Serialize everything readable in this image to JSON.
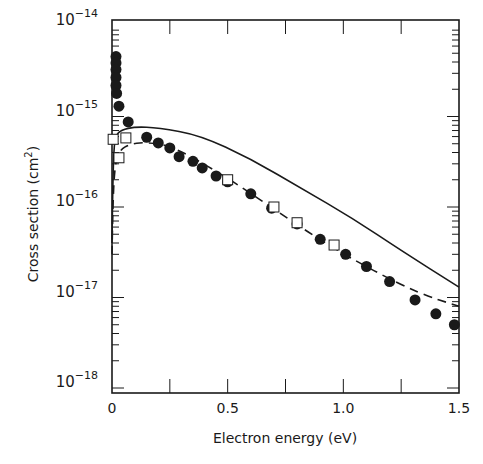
{
  "chart_data": {
    "type": "scatter",
    "title": "",
    "xlabel": "Electron energy (eV)",
    "ylabel": "Cross section (cm",
    "ylabel_sup": "2",
    "ylabel_close": ")",
    "xscale": "linear",
    "yscale": "log",
    "xlim": [
      0,
      1.5
    ],
    "ylim": [
      1e-18,
      1e-14
    ],
    "grid": false,
    "legend": null,
    "x_ticks": [
      {
        "value": 0,
        "label": "0"
      },
      {
        "value": 0.5,
        "label": "0.5"
      },
      {
        "value": 1.0,
        "label": "1.0"
      },
      {
        "value": 1.5,
        "label": "1.5"
      }
    ],
    "x_minor_ticks": [
      0.25,
      0.75,
      1.25
    ],
    "y_ticks": [
      {
        "value": 1e-14,
        "base": "10",
        "exp": "−14"
      },
      {
        "value": 1e-15,
        "base": "10",
        "exp": "−15"
      },
      {
        "value": 1e-16,
        "base": "10",
        "exp": "−16"
      },
      {
        "value": 1e-17,
        "base": "10",
        "exp": "−17"
      },
      {
        "value": 1e-18,
        "base": "10",
        "exp": "−18"
      }
    ],
    "series": [
      {
        "name": "Filled circles (measured)",
        "marker": "filled-circle",
        "x": [
          0.005,
          0.01,
          0.01,
          0.013,
          0.015,
          0.02,
          0.03,
          0.07,
          0.15,
          0.2,
          0.25,
          0.29,
          0.35,
          0.39,
          0.45,
          0.5,
          0.6,
          0.69,
          0.8,
          0.9,
          1.01,
          1.1,
          1.2,
          1.31,
          1.4,
          1.48
        ],
        "y": [
          4.6e-15,
          3.9e-15,
          3.3e-15,
          2.7e-15,
          2.2e-15,
          1.8e-15,
          1.3e-15,
          8.7e-16,
          5.9e-16,
          5.1e-16,
          4.5e-16,
          3.6e-16,
          3.2e-16,
          2.7e-16,
          2.2e-16,
          1.9e-16,
          1.4e-16,
          9.7e-17,
          6.5e-17,
          4.4e-17,
          3e-17,
          2.2e-17,
          1.5e-17,
          9.4e-18,
          6.6e-18,
          5e-18
        ]
      },
      {
        "name": "Open squares (measured)",
        "marker": "open-square",
        "x": [
          0.005,
          0.03,
          0.06,
          0.5,
          0.7,
          0.8,
          0.96
        ],
        "y": [
          5.6e-16,
          3.5e-16,
          5.8e-16,
          2e-16,
          1e-16,
          6.7e-17,
          3.8e-17
        ]
      },
      {
        "name": "Solid curve (theory)",
        "style": "solid-line",
        "x": [
          0.0,
          0.003,
          0.008,
          0.017,
          0.04,
          0.1,
          0.2,
          0.38,
          0.6,
          0.82,
          1.04,
          1.25,
          1.5
        ],
        "y": [
          4e-17,
          1.5e-16,
          4.5e-16,
          6.2e-16,
          7.1e-16,
          7.7e-16,
          7.5e-16,
          6.2e-16,
          3.4e-16,
          1.6e-16,
          7.5e-17,
          3.3e-17,
          1.3e-17
        ]
      },
      {
        "name": "Dashed curve (theory)",
        "style": "dashed-line",
        "x": [
          0.0,
          0.004,
          0.012,
          0.03,
          0.08,
          0.16,
          0.27,
          0.5,
          0.7,
          0.9,
          1.11,
          1.33,
          1.5
        ],
        "y": [
          3e-17,
          1.1e-16,
          2.8e-16,
          4.2e-16,
          5e-16,
          5.2e-16,
          4.6e-16,
          2.1e-16,
          9.5e-17,
          4.3e-17,
          2.1e-17,
          1.1e-17,
          8e-18
        ]
      }
    ]
  }
}
